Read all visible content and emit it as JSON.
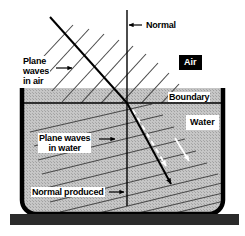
{
  "figure": {
    "labels": {
      "plane_waves_in_air_line1": "Plane",
      "plane_waves_in_air_line2": "waves",
      "plane_waves_in_air_line3": "in air",
      "normal": "Normal",
      "air": "Air",
      "boundary": "Boundary",
      "water": "Water",
      "plane_waves_in_water_line1": "Plane waves",
      "plane_waves_in_water_line2": "in water",
      "normal_produced": "Normal produced"
    },
    "colors": {
      "ink": "#000000",
      "background": "#ffffff",
      "water_fill": "#b9b9b9",
      "wavefront": "#555555",
      "tank_wall": "#000000",
      "base_bar": "#2b2b2b",
      "highlight_arrow": "#ffffff"
    },
    "geometry": {
      "boundary_y": 103,
      "incidence_point_x": 127,
      "incident_ray_start": [
        50,
        17
      ],
      "incident_ray_end": [
        127,
        103
      ],
      "refracted_ray_end": [
        173,
        187
      ],
      "normal_line_x": 127,
      "normal_top_y": 10,
      "normal_bottom_y": 205,
      "tank_left_x": 22,
      "tank_right_x": 223,
      "tank_top_y": 88,
      "tank_bottom_y": 211,
      "base_bar": [
        10,
        213,
        229,
        11
      ],
      "wavefronts_in_air": 11,
      "wavefronts_in_water": 11
    }
  }
}
